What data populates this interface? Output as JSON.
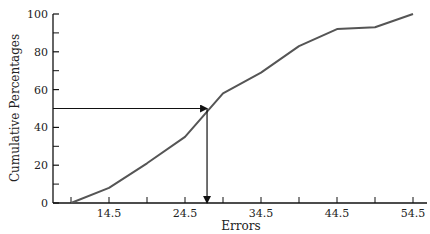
{
  "chart_data": {
    "type": "line",
    "title": "",
    "xlabel": "Errors",
    "ylabel": "Cumulative Percentages",
    "x": [
      9.5,
      14.5,
      19.5,
      24.5,
      29.5,
      34.5,
      39.5,
      44.5,
      49.5,
      54.5
    ],
    "series": [
      {
        "name": "Cumulative percentage",
        "values": [
          0,
          8,
          21,
          35,
          58,
          69,
          83,
          92,
          93,
          100
        ]
      }
    ],
    "x_tick_labels": [
      "14.5",
      "24.5",
      "34.5",
      "44.5",
      "54.5"
    ],
    "x_tick_positions": [
      9.5,
      14.5,
      19.5,
      24.5,
      29.5,
      34.5,
      39.5,
      44.5,
      49.5,
      54.5
    ],
    "y_tick_labels": [
      "0",
      "20",
      "40",
      "60",
      "80",
      "100"
    ],
    "y_minor_ticks": [
      10,
      30,
      50,
      70,
      90
    ],
    "xlim": [
      7.5,
      56.5
    ],
    "ylim": [
      0,
      100
    ],
    "grid": false,
    "legend": "none",
    "annotations": [
      {
        "type": "arrow-horizontal",
        "description": "From y-axis at 50% to the curve",
        "y": 50,
        "x_end": 27.4
      },
      {
        "type": "arrow-vertical",
        "description": "From curve down to x-axis (median)",
        "x": 27.4,
        "y_start": 50,
        "y_end": 0
      }
    ]
  }
}
